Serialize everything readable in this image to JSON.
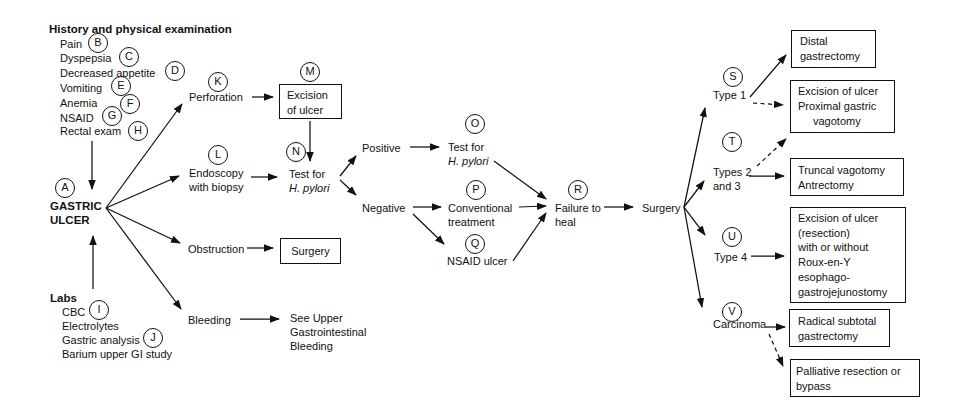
{
  "history": {
    "heading": "History and physical examination",
    "items": [
      {
        "label": "Pain",
        "letter": "B"
      },
      {
        "label": "Dyspepsia",
        "letter": "C"
      },
      {
        "label": "Decreased appetite",
        "letter": "D"
      },
      {
        "label": "Vomiting",
        "letter": "E"
      },
      {
        "label": "Anemia",
        "letter": "F"
      },
      {
        "label": "NSAID",
        "letter": "G"
      },
      {
        "label": "Rectal exam",
        "letter": "H"
      }
    ]
  },
  "labs": {
    "heading": "Labs",
    "items": [
      {
        "label": "CBC",
        "letter": "I"
      },
      {
        "label": "Electrolytes",
        "letter": ""
      },
      {
        "label": "Gastric analysis",
        "letter": "J"
      },
      {
        "label": "Barium upper GI study",
        "letter": ""
      }
    ]
  },
  "nodes": {
    "gastric_ulcer": {
      "letter": "A",
      "line1": "GASTRIC",
      "line2": "ULCER"
    },
    "perforation": {
      "letter": "K",
      "label": "Perforation"
    },
    "endoscopy": {
      "letter": "L",
      "line1": "Endoscopy",
      "line2": "with biopsy"
    },
    "obstruction": {
      "label": "Obstruction"
    },
    "bleeding": {
      "label": "Bleeding"
    },
    "excision_of_ulcer_box": {
      "letter": "M",
      "line1": "Excision",
      "line2": "of ulcer"
    },
    "test_hpylori_n": {
      "letter": "N",
      "line1": "Test for",
      "line2": "H. pylori"
    },
    "surgery_box": {
      "label": "Surgery"
    },
    "see_upper_gi": {
      "line1": "See Upper",
      "line2": "Gastrointestinal",
      "line3": "Bleeding"
    },
    "positive": {
      "label": "Positive"
    },
    "negative": {
      "label": "Negative"
    },
    "test_hpylori_o": {
      "letter": "O",
      "line1": "Test for",
      "line2": "H. pylori"
    },
    "conventional": {
      "letter": "P",
      "line1": "Conventional",
      "line2": "treatment"
    },
    "nsaid_ulcer": {
      "letter": "Q",
      "label": "NSAID ulcer"
    },
    "failure_to_heal": {
      "letter": "R",
      "line1": "Failure to",
      "line2": "heal"
    },
    "surgery": {
      "label": "Surgery"
    },
    "type1": {
      "letter": "S",
      "label": "Type 1"
    },
    "types23": {
      "letter": "T",
      "line1": "Types 2",
      "line2": "and 3"
    },
    "type4": {
      "letter": "U",
      "label": "Type 4"
    },
    "carcinoma": {
      "letter": "V",
      "label": "Carcinoma"
    }
  },
  "outcome_boxes": {
    "distal": {
      "lines": [
        "Distal",
        "gastrectomy"
      ]
    },
    "excision_proximal": {
      "lines": [
        "Excision of ulcer",
        "Proximal gastric",
        "vagotomy"
      ]
    },
    "truncal": {
      "lines": [
        "Truncal vagotomy",
        "Antrectomy"
      ]
    },
    "excision_roux": {
      "lines": [
        "Excision of ulcer",
        "(resection)",
        "with or without",
        "Roux-en-Y",
        "esophago-",
        "gastrojejunostomy"
      ]
    },
    "radical": {
      "lines": [
        "Radical subtotal",
        "gastrectomy"
      ]
    },
    "palliative": {
      "lines": [
        "Palliative resection or",
        "bypass"
      ]
    }
  },
  "colors": {
    "ink": "#111111",
    "background": "#ffffff"
  }
}
